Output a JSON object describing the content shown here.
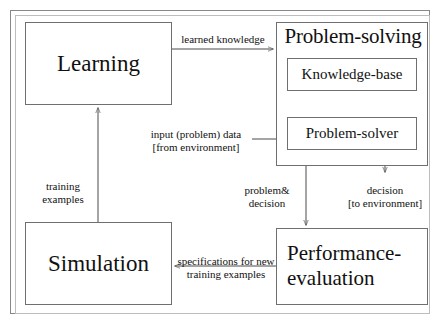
{
  "diagram": {
    "nodes": {
      "learning": "Learning",
      "problem_solving": "Problem-solving",
      "knowledge_base": "Knowledge-base",
      "problem_solver": "Problem-solver",
      "simulation": "Simulation",
      "performance_evaluation_line1": "Performance-",
      "performance_evaluation_line2": "evaluation"
    },
    "edges": {
      "learned_knowledge": "learned knowledge",
      "input_data_line1": "input (problem) data",
      "input_data_line2": "[from environment]",
      "training_line1": "training",
      "training_line2": "examples",
      "problem_decision_line1": "problem&",
      "problem_decision_line2": "decision",
      "decision_line1": "decision",
      "decision_line2": "[to environment]",
      "specifications_line1": "specifications for new",
      "specifications_line2": "training examples"
    },
    "colors": {
      "stroke": "#4a4a4a",
      "box_border": "#6f6f6f",
      "frame_border": "#888888",
      "text": "#111111",
      "background": "#ffffff"
    }
  }
}
